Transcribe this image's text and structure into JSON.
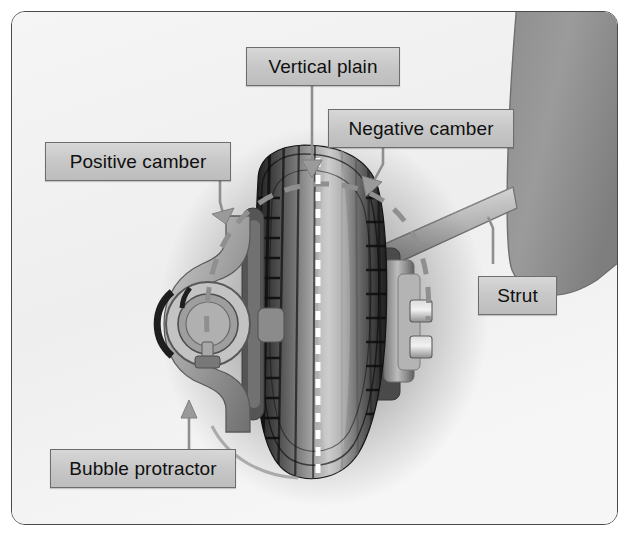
{
  "figure": {
    "background_color": "#f2f2f2",
    "border_color": "#4a4a4a",
    "callout_fill": "#cccccc",
    "callout_border": "#6d6d6d",
    "leader_color": "#8a8a8a",
    "centerline_color": "#ffffff"
  },
  "callouts": {
    "positive_camber": "Positive camber",
    "vertical_plain": "Vertical plain",
    "negative_camber": "Negative camber",
    "strut": "Strut",
    "bubble_protractor": "Bubble protractor"
  },
  "parts": {
    "tire_label": "tire",
    "wheel_hub_label": "wheel-hub",
    "lug_nuts_label": "lug-nuts",
    "strut_arm_label": "strut-arm",
    "body_panel_label": "vehicle-body-panel",
    "protractor_label": "bubble-protractor-gauge",
    "dashed_arc_label": "camber-range-arc",
    "centerline_label": "vertical-centerline"
  }
}
